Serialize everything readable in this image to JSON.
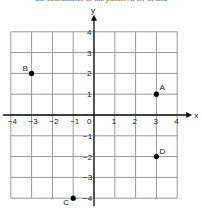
{
  "caption": "the coordinates of the points A, B, C, and",
  "chart_data": {
    "type": "scatter",
    "title": "",
    "xlabel": "x",
    "ylabel": "y",
    "xlim": [
      -4,
      4
    ],
    "ylim": [
      -4,
      4
    ],
    "grid": true,
    "x_ticks": [
      -4,
      -3,
      -2,
      -1,
      0,
      1,
      2,
      3,
      4
    ],
    "y_ticks": [
      -4,
      -3,
      -2,
      -1,
      1,
      2,
      3,
      4
    ],
    "points": [
      {
        "label": "A",
        "x": 3,
        "y": 1
      },
      {
        "label": "B",
        "x": -3,
        "y": 2
      },
      {
        "label": "C",
        "x": -1,
        "y": -4
      },
      {
        "label": "D",
        "x": 3,
        "y": -2
      }
    ]
  }
}
